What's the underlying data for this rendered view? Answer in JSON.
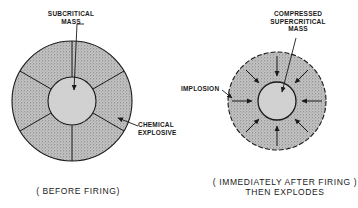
{
  "left_diagram": {
    "label_core": "SUBCRITICAL\nMASS",
    "label_core_line1": "SUBCRITICAL",
    "label_core_line2": "MASS",
    "label_explosive_line1": "CHEMICAL",
    "label_explosive_line2": "EXPLOSIVE",
    "caption": "( BEFORE FIRING)",
    "segments": 6
  },
  "right_diagram": {
    "label_core_line1": "COMPRESSED",
    "label_core_line2": "SUPERCRITICAL",
    "label_core_line3": "MASS",
    "label_implosion": "IMPLOSION",
    "caption_line1": "( IMMEDIATELY AFTER FIRING )",
    "caption_line2": "THEN EXPLODES",
    "arrows": 8
  },
  "colors": {
    "ink": "#1a1a1a",
    "explosive_fill": "#b8b8b8",
    "core_fill": "#d4d4d4"
  }
}
